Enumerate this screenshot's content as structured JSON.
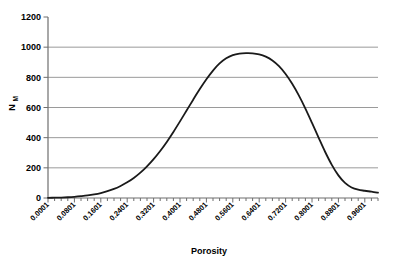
{
  "chart_data": {
    "type": "line",
    "title": "",
    "subtitle": "",
    "xlabel": "Porosity",
    "ylabel": "N",
    "ylabel_subscript": "M",
    "ylabel_full": "NM",
    "xlim": [
      0.0001,
      1.0001
    ],
    "ylim": [
      0,
      1200
    ],
    "grid": true,
    "grid_axis": "y",
    "legend": null,
    "legend_position": "none",
    "x_tick_labels": [
      "0.0001",
      "0.0801",
      "0.1601",
      "0.2401",
      "0.3201",
      "0.4001",
      "0.4801",
      "0.5601",
      "0.6401",
      "0.7201",
      "0.8001",
      "0.8801",
      "0.9601"
    ],
    "x_tick_values": [
      0.0001,
      0.0801,
      0.1601,
      0.2401,
      0.3201,
      0.4001,
      0.4801,
      0.5601,
      0.6401,
      0.7201,
      0.8001,
      0.8801,
      0.9601
    ],
    "y_tick_labels": [
      "0",
      "200",
      "400",
      "600",
      "800",
      "1000",
      "1200"
    ],
    "y_tick_values": [
      0,
      200,
      400,
      600,
      800,
      1000,
      1200
    ],
    "minor_ticks_per_interval": 4,
    "line_color": "#1a1a1a",
    "line_width": 1.8,
    "grid_color": "#9a9a9a",
    "axis_color": "#6e6e6e",
    "background_color": "#ffffff",
    "series": [
      {
        "name": "NM",
        "x": [
          0.0001,
          0.0201,
          0.0401,
          0.0601,
          0.0801,
          0.1001,
          0.1201,
          0.1401,
          0.1601,
          0.1801,
          0.2001,
          0.2201,
          0.2401,
          0.2601,
          0.2801,
          0.3001,
          0.3201,
          0.3401,
          0.3601,
          0.3801,
          0.4001,
          0.4201,
          0.4401,
          0.4601,
          0.4801,
          0.5001,
          0.5201,
          0.5401,
          0.5601,
          0.5801,
          0.6001,
          0.6201,
          0.6401,
          0.6601,
          0.6801,
          0.7001,
          0.7201,
          0.7401,
          0.7601,
          0.7801,
          0.8001,
          0.8201,
          0.8401,
          0.8601,
          0.8801,
          0.9001,
          0.9201,
          0.9401,
          0.9601,
          0.9801,
          1.0001
        ],
        "y": [
          1,
          2,
          3,
          5,
          8,
          12,
          17,
          24,
          33,
          45,
          60,
          80,
          104,
          133,
          168,
          210,
          258,
          312,
          372,
          438,
          508,
          580,
          652,
          722,
          787,
          845,
          892,
          926,
          947,
          957,
          960,
          959,
          952,
          937,
          912,
          874,
          822,
          757,
          680,
          593,
          498,
          400,
          305,
          220,
          150,
          100,
          70,
          55,
          48,
          42,
          35
        ]
      }
    ],
    "annotations": []
  },
  "axis": {
    "y_title": "N",
    "y_title_sub": "M",
    "x_title": "Porosity"
  }
}
